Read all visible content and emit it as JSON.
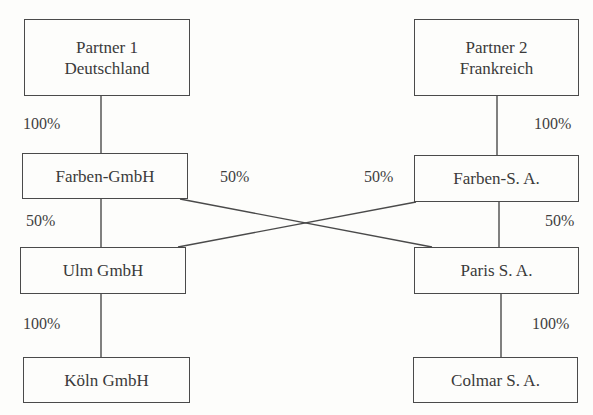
{
  "boxes": {
    "partner1": {
      "line1": "Partner 1",
      "line2": "Deutschland"
    },
    "partner2": {
      "line1": "Partner 2",
      "line2": "Frankreich"
    },
    "farben_gmbh": {
      "label": "Farben-GmbH"
    },
    "farben_sa": {
      "label": "Farben-S. A."
    },
    "ulm_gmbh": {
      "label": "Ulm GmbH"
    },
    "paris_sa": {
      "label": "Paris S. A."
    },
    "koeln_gmbh": {
      "label": "Köln GmbH"
    },
    "colmar_sa": {
      "label": "Colmar S. A."
    }
  },
  "percentages": {
    "p1_to_farben_gmbh": "100%",
    "p2_to_farben_sa": "100%",
    "farben_gmbh_to_paris": "50%",
    "farben_sa_to_ulm": "50%",
    "farben_gmbh_to_ulm": "50%",
    "farben_sa_to_paris": "50%",
    "ulm_to_koeln": "100%",
    "paris_to_colmar": "100%"
  }
}
